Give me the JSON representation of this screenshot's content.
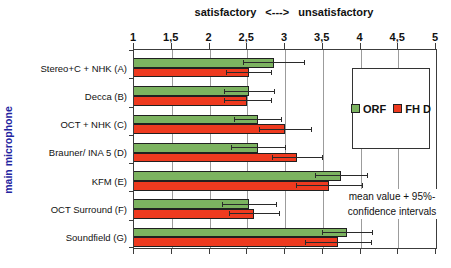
{
  "chart_data": {
    "type": "bar",
    "orientation": "horizontal",
    "title_left": "satisfactory",
    "title_arrow": "<--->",
    "title_right": "unsatisfactory",
    "ylabel": "main microphone",
    "xlim": [
      1,
      5
    ],
    "xticks": [
      1,
      1.5,
      2,
      2.5,
      3,
      3.5,
      4,
      4.5,
      5
    ],
    "xtick_labels": [
      "1",
      "1,5",
      "2",
      "2,5",
      "3",
      "3,5",
      "4",
      "4,5",
      "5"
    ],
    "categories": [
      "Stereo+C + NHK (A)",
      "Decca (B)",
      "OCT + NHK (C)",
      "Brauner/ INA 5 (D)",
      "KFM (E)",
      "OCT Surround (F)",
      "Soundfield (G)"
    ],
    "series": [
      {
        "name": "ORF",
        "color": "#7cb360",
        "means": [
          2.85,
          2.52,
          2.64,
          2.64,
          3.74,
          2.52,
          3.82
        ],
        "ci": [
          0.4,
          0.33,
          0.31,
          0.36,
          0.34,
          0.36,
          0.33
        ]
      },
      {
        "name": "FH D",
        "color": "#ee3a1f",
        "means": [
          2.52,
          2.5,
          3.0,
          3.16,
          3.58,
          2.59,
          3.7
        ],
        "ci": [
          0.3,
          0.31,
          0.35,
          0.33,
          0.44,
          0.33,
          0.44
        ]
      }
    ],
    "annotation_lines": [
      "mean value + 95%-",
      "confidence intervals"
    ],
    "grid": "vertical",
    "legend_position": "inside-right",
    "colors": {
      "axis": "#3c3c3c",
      "grid": "#9c9c9c",
      "ylabel_text": "#2323a0",
      "bar_border": "#202020"
    }
  }
}
